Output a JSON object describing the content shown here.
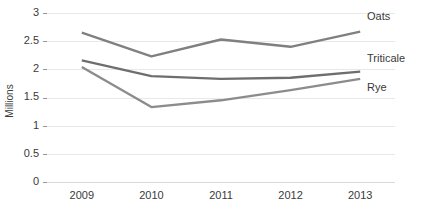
{
  "chart_data": {
    "type": "line",
    "title": "",
    "xlabel": "",
    "ylabel": "Millions",
    "categories": [
      "2009",
      "2010",
      "2011",
      "2012",
      "2013"
    ],
    "x": [
      2009,
      2010,
      2011,
      2012,
      2013
    ],
    "ylim": [
      0,
      3
    ],
    "ytick_labels": [
      "0",
      "0.5",
      "1",
      "1.5",
      "2",
      "2.5",
      "3"
    ],
    "ytick_values": [
      0,
      0.5,
      1,
      1.5,
      2,
      2.5,
      3
    ],
    "grid": "horizontal",
    "legend": "inline-right-labels",
    "series": [
      {
        "name": "Oats",
        "color": "#808080",
        "values": [
          2.65,
          2.23,
          2.53,
          2.4,
          2.67
        ]
      },
      {
        "name": "Triticale",
        "color": "#6e6e6e",
        "values": [
          2.16,
          1.88,
          1.83,
          1.85,
          1.96
        ]
      },
      {
        "name": "Rye",
        "color": "#8c8c8c",
        "values": [
          2.04,
          1.33,
          1.45,
          1.63,
          1.83
        ]
      }
    ],
    "annotations": [
      {
        "text": "Oats",
        "series": "Oats"
      },
      {
        "text": "Triticale",
        "series": "Triticale"
      },
      {
        "text": "Rye",
        "series": "Rye"
      }
    ]
  },
  "colors": {
    "gridline": "#e8e8e8",
    "axis": "#d9d9d9",
    "text": "#3a3a3a",
    "background": "#ffffff"
  }
}
